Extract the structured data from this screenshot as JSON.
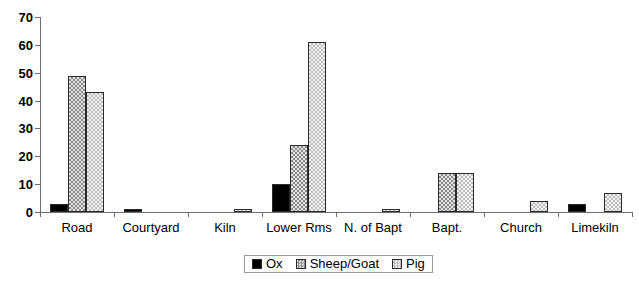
{
  "chart_data": {
    "type": "bar",
    "title": "",
    "subtitle": "",
    "xlabel": "",
    "ylabel": "",
    "ylim": [
      0,
      70
    ],
    "yticks": [
      0,
      10,
      20,
      30,
      40,
      50,
      60,
      70
    ],
    "grid": false,
    "legend_position": "bottom-center",
    "categories": [
      "Road",
      "Courtyard",
      "Kiln",
      "Lower Rms",
      "N. of Bapt",
      "Bapt.",
      "Church",
      "Limekiln"
    ],
    "series": [
      {
        "name": "Ox",
        "color": "#000000",
        "pattern": "solid",
        "values": [
          3,
          1,
          0,
          10,
          0,
          0,
          0,
          3
        ]
      },
      {
        "name": "Sheep/Goat",
        "color": "#bcbcbc",
        "pattern": "dense-checker",
        "values": [
          49,
          0,
          0,
          24,
          0,
          14,
          0,
          0
        ]
      },
      {
        "name": "Pig",
        "color": "#e3e3e3",
        "pattern": "light-checker",
        "values": [
          43,
          0,
          1,
          61,
          1,
          14,
          4,
          7
        ]
      }
    ]
  },
  "legend": {
    "entries": [
      {
        "label": "Ox",
        "swatch": "ox"
      },
      {
        "label": "Sheep/Goat",
        "swatch": "sheep"
      },
      {
        "label": "Pig",
        "swatch": "pig"
      }
    ]
  },
  "axis": {
    "y_tick_labels": [
      "0",
      "10",
      "20",
      "30",
      "40",
      "50",
      "60",
      "70"
    ]
  }
}
